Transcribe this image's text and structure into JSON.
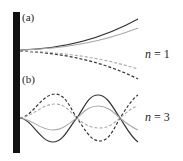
{
  "figure": {
    "panels": [
      {
        "label": "(a)",
        "mode_symbol": "n",
        "mode_eq": " = 1",
        "description": "First mode of cantilever: curves diverging from clamped wall"
      },
      {
        "label": "(b)",
        "mode_symbol": "n",
        "mode_eq": " = 3",
        "description": "Third mode of cantilever: oscillating curves crossing baseline"
      }
    ],
    "colors": {
      "wall": "#111111",
      "dark_line": "#333333",
      "light_line": "#aaaaaa"
    },
    "line_styles": [
      "dark-solid",
      "light-solid",
      "dark-dashed",
      "light-dashed"
    ]
  }
}
